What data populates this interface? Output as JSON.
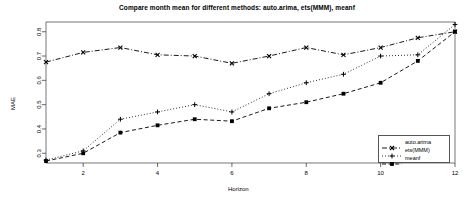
{
  "chart_data": {
    "type": "line",
    "title": "Compare month mean for different methods: auto.arima, ets(MMM), meanf",
    "xlabel": "Horizon",
    "ylabel": "MAE",
    "x": [
      1,
      2,
      3,
      4,
      5,
      6,
      7,
      8,
      9,
      10,
      11,
      12
    ],
    "xlim": [
      1,
      12
    ],
    "ylim": [
      0.26,
      0.84
    ],
    "xticks": [
      2,
      4,
      6,
      8,
      10,
      12
    ],
    "yticks": [
      0.3,
      0.4,
      0.5,
      0.6,
      0.7,
      0.8
    ],
    "grid": false,
    "legend_position": "bottom-right",
    "series": [
      {
        "name": "auto.arima",
        "marker": "x",
        "linestyle": "dashdot",
        "color": "#000000",
        "values": [
          0.675,
          0.715,
          0.735,
          0.705,
          0.7,
          0.67,
          0.7,
          0.735,
          0.705,
          0.735,
          0.775,
          0.8
        ]
      },
      {
        "name": "ets(MMM)",
        "marker": "plus",
        "linestyle": "dotted",
        "color": "#000000",
        "values": [
          0.272,
          0.31,
          0.44,
          0.47,
          0.5,
          0.47,
          0.545,
          0.59,
          0.625,
          0.7,
          0.705,
          0.83
        ]
      },
      {
        "name": "meanf",
        "marker": "square",
        "linestyle": "dashed",
        "color": "#000000",
        "values": [
          0.268,
          0.3,
          0.385,
          0.415,
          0.44,
          0.432,
          0.485,
          0.51,
          0.545,
          0.59,
          0.68,
          0.8
        ]
      }
    ]
  },
  "legend": {
    "items": [
      {
        "label": "auto.arima",
        "marker": "x",
        "linestyle": "dashdot"
      },
      {
        "label": "ets(MMM)",
        "marker": "plus",
        "linestyle": "dotted"
      },
      {
        "label": "meanf",
        "marker": "square",
        "linestyle": "dashed"
      }
    ]
  }
}
